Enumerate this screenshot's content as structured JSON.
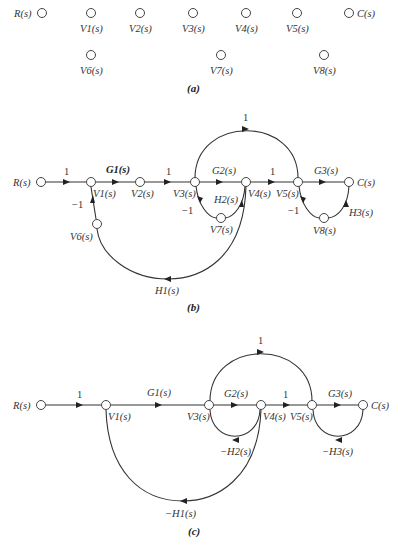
{
  "figure": {
    "panels": [
      {
        "id": "a",
        "caption": "(a)",
        "nodes": {
          "R": "R(s)",
          "V1": "V1(s)",
          "V2": "V2(s)",
          "V3": "V3(s)",
          "V4": "V4(s)",
          "V5": "V5(s)",
          "C": "C(s)",
          "V6": "V6(s)",
          "V7": "V7(s)",
          "V8": "V8(s)"
        }
      },
      {
        "id": "b",
        "caption": "(b)",
        "nodes": {
          "R": "R(s)",
          "V1": "V1(s)",
          "V2": "V2(s)",
          "V3": "V3(s)",
          "V4": "V4(s)",
          "V5": "V5(s)",
          "C": "C(s)",
          "V6": "V6(s)",
          "V7": "V7(s)",
          "V8": "V8(s)"
        },
        "edges": {
          "R_V1": "1",
          "V1_V2": "G1(s)",
          "V2_V3": "1",
          "V3_V4": "G2(s)",
          "V4_V5": "1",
          "V5_C": "G3(s)",
          "V3_V5": "1",
          "V6_V1": "−1",
          "V4_V6": "H1(s)",
          "V7_V3": "−1",
          "V4_V7": "H2(s)",
          "V8_V5": "−1",
          "C_V8": "H3(s)"
        }
      },
      {
        "id": "c",
        "caption": "(c)",
        "nodes": {
          "R": "R(s)",
          "V1": "V1(s)",
          "V3": "V3(s)",
          "V4": "V4(s)",
          "V5": "V5(s)",
          "C": "C(s)"
        },
        "edges": {
          "R_V1": "1",
          "V1_V3": "G1(s)",
          "V3_V4": "G2(s)",
          "V4_V5": "1",
          "V5_C": "G3(s)",
          "V3_V5": "1",
          "V4_V1": "−H1(s)",
          "V4_V3": "−H2(s)",
          "C_V5": "−H3(s)"
        }
      }
    ]
  }
}
